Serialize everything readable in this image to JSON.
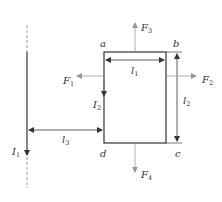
{
  "diagram": {
    "colors": {
      "wire": "#333333",
      "force": "#999999",
      "dashed": "#999999",
      "text": "#333333"
    },
    "wire": {
      "current_label": "I",
      "current_sub": "1"
    },
    "loop": {
      "current_label": "I",
      "current_sub": "2",
      "corners": {
        "a": "a",
        "b": "b",
        "c": "c",
        "d": "d"
      }
    },
    "dimensions": {
      "l1": {
        "label": "l",
        "sub": "1"
      },
      "l2": {
        "label": "l",
        "sub": "2"
      },
      "l3": {
        "label": "l",
        "sub": "3"
      }
    },
    "forces": {
      "F1": {
        "label": "F",
        "sub": "1"
      },
      "F2": {
        "label": "F",
        "sub": "2"
      },
      "F3": {
        "label": "F",
        "sub": "3"
      },
      "F4": {
        "label": "F",
        "sub": "4"
      }
    }
  }
}
